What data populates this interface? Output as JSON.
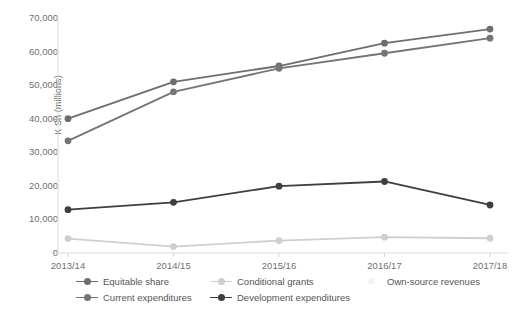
{
  "chart_data": {
    "type": "line",
    "title": "",
    "xlabel": "",
    "ylabel": "K Sh (millions)",
    "categories": [
      "2013/14",
      "2014/15",
      "2015/16",
      "2016/17",
      "2017/18"
    ],
    "yticks": [
      0,
      10000,
      20000,
      30000,
      40000,
      50000,
      60000,
      70000
    ],
    "ytick_labels": [
      "0",
      "10,000",
      "20,000",
      "30,000",
      "40,000",
      "50,000",
      "60,000",
      "70,000"
    ],
    "ylim": [
      0,
      70000
    ],
    "grid": false,
    "legend_position": "bottom",
    "series": [
      {
        "name": "Equitable share",
        "color": "#6e6e6e",
        "values": [
          40000,
          51000,
          55700,
          62500,
          66700
        ]
      },
      {
        "name": "Conditional grants",
        "color": "#cfcfcf",
        "values": [
          4300,
          1900,
          3700,
          4700,
          4400
        ]
      },
      {
        "name": "Own-source revenues",
        "color": "#f2f2f2",
        "values": [
          null,
          null,
          null,
          null,
          null
        ]
      },
      {
        "name": "Current expenditures",
        "color": "#757575",
        "values": [
          33400,
          48000,
          55000,
          59500,
          64000
        ]
      },
      {
        "name": "Development expenditures",
        "color": "#3f3f3f",
        "values": [
          12900,
          15100,
          19900,
          21300,
          14300
        ]
      }
    ],
    "axis_color": "#d9d9d9",
    "text_color": "#6f6f6f"
  },
  "legend": {
    "items": [
      {
        "label": "Equitable share",
        "color": "#6e6e6e",
        "has_line": true
      },
      {
        "label": "Conditional grants",
        "color": "#cfcfcf",
        "has_line": true
      },
      {
        "label": "Own-source revenues",
        "color": "#f4f4f4",
        "has_line": false
      },
      {
        "label": "Current expenditures",
        "color": "#757575",
        "has_line": true
      },
      {
        "label": "Development expenditures",
        "color": "#3f3f3f",
        "has_line": true
      }
    ]
  }
}
